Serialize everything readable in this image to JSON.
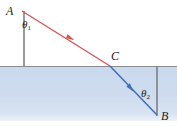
{
  "figure": {
    "width": 177,
    "height": 126
  },
  "colors": {
    "incident_ray": "#d9534f",
    "refracted_ray": "#3f6fb5",
    "water_fill": "#cfdcee",
    "surface_line": "#8c8c8c",
    "normal_line": "#8c8c8c",
    "label_text": "#1b1b1b",
    "background": "#ffffff"
  },
  "points": {
    "A": {
      "label": "A",
      "x": 22,
      "y": 11
    },
    "B": {
      "label": "B",
      "x": 157,
      "y": 115
    },
    "C": {
      "label": "C",
      "x": 110,
      "y": 66
    }
  },
  "angles": {
    "theta1": {
      "symbol": "θ",
      "subscript": "1"
    },
    "theta2": {
      "symbol": "θ",
      "subscript": "2"
    }
  },
  "geometry": {
    "surface_y": 66,
    "water_top": 66,
    "water_bottom": 121,
    "normal_left": {
      "x": 24,
      "y_top": 11,
      "y_bottom": 66
    },
    "normal_right": {
      "x": 157,
      "y_top": 66,
      "y_bottom": 115
    },
    "incident_arrow": {
      "x": 70,
      "y": 38
    },
    "refracted_arrow": {
      "x": 130,
      "y": 88
    }
  }
}
